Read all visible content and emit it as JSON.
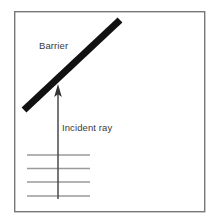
{
  "figure": {
    "background_color": "#ffffff",
    "frame": {
      "name": "figure-border",
      "x": 14,
      "y": 11,
      "width": 191,
      "height": 201,
      "stroke_color": "#777777",
      "fill_color": "#ffffff",
      "stroke_width": 1.4
    },
    "labels": {
      "barrier": "Barrier",
      "incident_ray": "Incident ray"
    },
    "label_color": "#3a3a3a",
    "barrier": {
      "name": "barrier-bar",
      "x1": 24,
      "y1": 110,
      "x2": 120,
      "y2": 20,
      "stroke_color": "#111111",
      "stroke_width": 7
    },
    "incident_ray": {
      "name": "incident-ray-arrow",
      "x": 58,
      "y_tail": 199,
      "y_tip": 84,
      "stroke_color": "#4a4a4a",
      "stroke_width": 1.5,
      "arrow_head_width": 7,
      "arrow_head_length": 13,
      "arrow_head_color": "#333333"
    },
    "wavefronts": {
      "name": "wavefront-lines",
      "x_start": 27,
      "x_end": 90,
      "stroke_color": "#9a9a9a",
      "stroke_width": 1.6,
      "y_positions": [
        155,
        168.5,
        182,
        196
      ]
    },
    "label_positions": {
      "barrier": {
        "x": 39,
        "y": 49
      },
      "incident_ray": {
        "x": 62,
        "y": 131
      }
    }
  }
}
